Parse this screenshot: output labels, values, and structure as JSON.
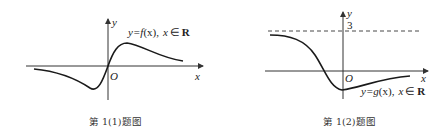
{
  "figures": [
    {
      "id": "fig1",
      "caption": "第 1(1)题图",
      "function_label_prefix": "y=",
      "function_label_name": "f",
      "function_label_var": "(x),",
      "domain_label_var": "x",
      "domain_label_in": "∈",
      "domain_label_set": "R",
      "axis_x_label": "x",
      "axis_y_label": "y",
      "origin_label": "O"
    },
    {
      "id": "fig2",
      "caption": "第 1(2)题图",
      "function_label_prefix": "y=",
      "function_label_name": "g",
      "function_label_var": "(x),",
      "domain_label_var": "x",
      "domain_label_in": "∈",
      "domain_label_set": "R",
      "axis_x_label": "x",
      "axis_y_label": "y",
      "origin_label": "O",
      "asymptote_value": "3"
    }
  ]
}
